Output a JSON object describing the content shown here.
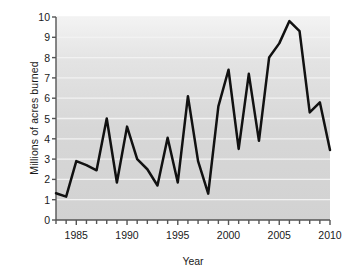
{
  "chart_data": {
    "type": "line",
    "title": "",
    "xlabel": "Year",
    "ylabel": "Millions of acres burned",
    "xlim": [
      1983,
      2010
    ],
    "ylim": [
      0,
      10
    ],
    "grid": true,
    "legend": "none",
    "line_color": "#111111",
    "plot_background": "#d6d6d6",
    "gridline_color": "#f2f2f2",
    "x_tick_labels": [
      "1985",
      "1990",
      "1995",
      "2000",
      "2005",
      "2010"
    ],
    "x_tick_values": [
      1985,
      1990,
      1995,
      2000,
      2005,
      2010
    ],
    "x_minor_ticks": [
      1983,
      1984,
      1985,
      1986,
      1987,
      1988,
      1989,
      1990,
      1991,
      1992,
      1993,
      1994,
      1995,
      1996,
      1997,
      1998,
      1999,
      2000,
      2001,
      2002,
      2003,
      2004,
      2005,
      2006,
      2007,
      2008,
      2009,
      2010
    ],
    "y_tick_labels": [
      "0",
      "1",
      "2",
      "3",
      "4",
      "5",
      "6",
      "7",
      "8",
      "9",
      "10"
    ],
    "y_tick_values": [
      0,
      1,
      2,
      3,
      4,
      5,
      6,
      7,
      8,
      9,
      10
    ],
    "x": [
      1983,
      1984,
      1985,
      1986,
      1987,
      1988,
      1989,
      1990,
      1991,
      1992,
      1993,
      1994,
      1995,
      1996,
      1997,
      1998,
      1999,
      2000,
      2001,
      2002,
      2003,
      2004,
      2005,
      2006,
      2007,
      2008,
      2009,
      2010
    ],
    "values": [
      1.32,
      1.15,
      2.9,
      2.7,
      2.45,
      5.0,
      1.85,
      4.6,
      3.0,
      2.5,
      1.7,
      4.05,
      1.85,
      6.1,
      2.9,
      1.3,
      5.6,
      7.4,
      3.5,
      7.2,
      3.9,
      8.0,
      8.7,
      9.8,
      9.3,
      5.3,
      5.8,
      3.45
    ],
    "series": [
      {
        "name": "Millions of acres burned",
        "values": [
          1.32,
          1.15,
          2.9,
          2.7,
          2.45,
          5.0,
          1.85,
          4.6,
          3.0,
          2.5,
          1.7,
          4.05,
          1.85,
          6.1,
          2.9,
          1.3,
          5.6,
          7.4,
          3.5,
          7.2,
          3.9,
          8.0,
          8.7,
          9.8,
          9.3,
          5.3,
          5.8,
          3.45
        ]
      }
    ]
  }
}
